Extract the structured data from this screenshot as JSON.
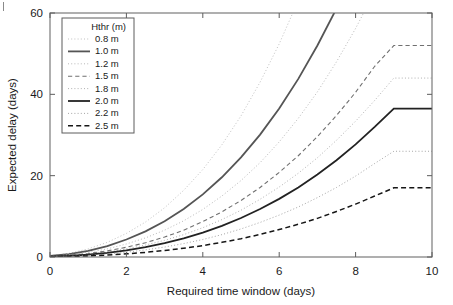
{
  "chart_data": {
    "type": "line",
    "title": "",
    "xlabel": "Required time window (days)",
    "ylabel": "Expected delay (days)",
    "xlim": [
      0,
      10
    ],
    "ylim": [
      0,
      60
    ],
    "xticks": [
      0,
      2,
      4,
      6,
      8,
      10
    ],
    "yticks": [
      0,
      20,
      40,
      60
    ],
    "xtick_labels": [
      "0",
      "2",
      "4",
      "6",
      "8",
      "10"
    ],
    "ytick_labels": [
      "0",
      "20",
      "40",
      "60"
    ],
    "grid": false,
    "legend_position": "upper left",
    "legend_title": "Hthr (m)",
    "x": [
      0,
      0.5,
      1,
      1.5,
      2,
      2.5,
      3,
      3.5,
      4,
      4.5,
      5,
      5.5,
      6,
      6.5,
      7,
      7.5,
      8,
      8.5,
      9,
      9.5,
      10
    ],
    "series": [
      {
        "name": "0.8 m",
        "label": "0.8 m",
        "style": "dotted",
        "width": 0.9,
        "color": "#b9b9b9",
        "values": [
          0.3,
          0.9,
          2.0,
          3.6,
          5.8,
          8.6,
          12.1,
          16.4,
          21.5,
          27.6,
          34.7,
          43.0,
          52.4,
          63.1,
          75.2,
          88.7,
          103.8,
          120.4,
          138.7,
          158.7,
          180.5
        ],
        "exits_top_at_x": 5.2
      },
      {
        "name": "1.0 m",
        "label": "1.0 m",
        "style": "solid",
        "width": 1.8,
        "color": "#555555",
        "values": [
          0.25,
          0.7,
          1.5,
          2.7,
          4.3,
          6.3,
          8.8,
          11.8,
          15.4,
          19.6,
          24.5,
          30.1,
          36.5,
          43.8,
          52.0,
          61.1,
          71.3,
          82.5,
          94.9,
          108.5,
          123.4
        ],
        "exits_top_at_x": 6.7
      },
      {
        "name": "1.2 m",
        "label": "1.2 m",
        "style": "dotted",
        "width": 0.9,
        "color": "#b0b0b0",
        "values": [
          0.2,
          0.55,
          1.15,
          2.0,
          3.2,
          4.7,
          6.6,
          8.9,
          11.7,
          15.0,
          18.8,
          23.2,
          28.3,
          34.1,
          40.6,
          48.0,
          56.2,
          65.3,
          75.4,
          86.6,
          98.8
        ],
        "exits_top_at_x": 8.2
      },
      {
        "name": "1.5 m",
        "label": "1.5 m",
        "style": "dashed",
        "width": 1.1,
        "color": "#707070",
        "values": [
          0.15,
          0.4,
          0.85,
          1.5,
          2.4,
          3.5,
          4.9,
          6.6,
          8.7,
          11.1,
          13.9,
          17.1,
          20.8,
          24.9,
          29.6,
          34.8,
          40.5,
          46.9,
          52.0,
          52.0,
          52.0
        ]
      },
      {
        "name": "1.8 m",
        "label": "1.8 m",
        "style": "dotted",
        "width": 0.9,
        "color": "#a8a8a8",
        "values": [
          0.12,
          0.33,
          0.7,
          1.25,
          2.0,
          2.95,
          4.1,
          5.5,
          7.2,
          9.2,
          11.5,
          14.2,
          17.2,
          20.6,
          24.4,
          28.7,
          33.4,
          38.5,
          44.0,
          44.0,
          44.0
        ]
      },
      {
        "name": "2.0 m",
        "label": "2.0 m",
        "style": "solid",
        "width": 1.8,
        "color": "#222222",
        "values": [
          0.1,
          0.27,
          0.58,
          1.03,
          1.65,
          2.45,
          3.4,
          4.6,
          6.0,
          7.65,
          9.6,
          11.8,
          14.3,
          17.1,
          20.3,
          23.8,
          27.7,
          32.0,
          36.5,
          36.5,
          36.5
        ]
      },
      {
        "name": "2.2 m",
        "label": "2.2 m",
        "style": "dotted",
        "width": 0.9,
        "color": "#9a9a9a",
        "values": [
          0.07,
          0.2,
          0.42,
          0.74,
          1.18,
          1.75,
          2.45,
          3.3,
          4.3,
          5.5,
          6.9,
          8.5,
          10.3,
          12.3,
          14.6,
          17.1,
          19.9,
          23.0,
          26.0,
          26.0,
          26.0
        ]
      },
      {
        "name": "2.5 m",
        "label": "2.5 m",
        "style": "dashed",
        "width": 1.5,
        "color": "#161616",
        "values": [
          0.04,
          0.13,
          0.27,
          0.48,
          0.77,
          1.14,
          1.6,
          2.15,
          2.8,
          3.6,
          4.5,
          5.55,
          6.75,
          8.05,
          9.5,
          11.2,
          13.0,
          15.0,
          17.0,
          17.0,
          17.0
        ]
      }
    ]
  }
}
